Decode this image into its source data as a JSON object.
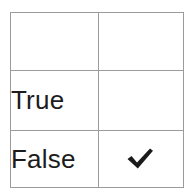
{
  "table": {
    "name": "truth-value-selection-table",
    "columns": [
      {
        "key": "label",
        "header": ""
      },
      {
        "key": "mark",
        "header": "check-icon"
      }
    ],
    "header": {
      "label_cell_text": "",
      "mark_cell_icon": "check-icon",
      "mark_cell_icon_color": "#ffffff",
      "background_color": "#4a4a4a"
    },
    "rows": [
      {
        "label": "True",
        "mark_icon": "",
        "mark_icon_color": "",
        "checked": "false"
      },
      {
        "label": "False",
        "mark_icon": "check-icon",
        "mark_icon_color": "#1a1a1a",
        "checked": "true"
      }
    ]
  },
  "colors": {
    "header_background": "#4a4a4a",
    "border": "#9b9b9b",
    "text": "#1c1c1c",
    "check_light": "#ffffff",
    "check_dark": "#1a1a1a",
    "page_background": "#ffffff"
  }
}
